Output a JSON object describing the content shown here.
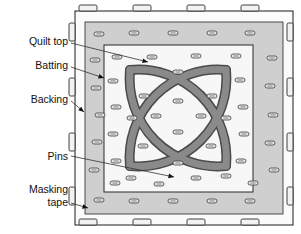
{
  "figure": {
    "type": "diagram"
  },
  "labels": [
    {
      "id": "quilt-top",
      "text": "Quilt top",
      "x": 68,
      "y": 42,
      "leader": {
        "x1": 71,
        "y1": 43,
        "x2": 148,
        "y2": 62
      }
    },
    {
      "id": "batting",
      "text": "Batting",
      "x": 68,
      "y": 66,
      "leader": {
        "x1": 71,
        "y1": 67,
        "x2": 104,
        "y2": 78
      }
    },
    {
      "id": "backing",
      "text": "Backing",
      "x": 68,
      "y": 100,
      "leader": {
        "x1": 71,
        "y1": 101,
        "x2": 84,
        "y2": 112
      }
    },
    {
      "id": "pins",
      "text": "Pins",
      "x": 68,
      "y": 157,
      "leader": {
        "x1": 71,
        "y1": 156,
        "x2": 174,
        "y2": 177
      }
    },
    {
      "id": "masking-1",
      "text": "Masking",
      "x": 68,
      "y": 190,
      "leader": null
    },
    {
      "id": "masking-2",
      "text": "tape",
      "x": 68,
      "y": 203,
      "leader": {
        "x1": 71,
        "y1": 203,
        "x2": 88,
        "y2": 208
      }
    }
  ],
  "colors": {
    "background": "#ffffff",
    "outline": "#1a1a1a",
    "backing": "#fbfbfb",
    "batting": "#cfcfcf",
    "quilt_top": "#f7f7f7",
    "tape": "#f2f2f2",
    "pin_fill": "#e8e8e8",
    "motif_band": "#8a8a8a",
    "motif_outline": "#4a4a4a",
    "label_text": "#101010",
    "leader_line": "#333333"
  },
  "geometry": {
    "backing_rect": {
      "x": 75,
      "y": 11,
      "w": 218,
      "h": 214
    },
    "batting_rect": {
      "x": 85,
      "y": 22,
      "w": 198,
      "h": 192
    },
    "quilt_top_rect": {
      "x": 104,
      "y": 45,
      "w": 149,
      "h": 147
    },
    "motif_center": {
      "cx": 178,
      "cy": 118
    },
    "motif_radius": 62
  },
  "tape_pieces": {
    "top": [
      {
        "x": 88,
        "y": 8
      },
      {
        "x": 142,
        "y": 8
      },
      {
        "x": 196,
        "y": 8
      },
      {
        "x": 250,
        "y": 8
      }
    ],
    "bottom": [
      {
        "x": 88,
        "y": 222
      },
      {
        "x": 142,
        "y": 222
      },
      {
        "x": 196,
        "y": 222
      },
      {
        "x": 250,
        "y": 222
      }
    ],
    "left": [
      {
        "x": 72,
        "y": 32
      },
      {
        "x": 72,
        "y": 87
      },
      {
        "x": 72,
        "y": 142
      },
      {
        "x": 72,
        "y": 196
      }
    ],
    "right": [
      {
        "x": 290,
        "y": 32
      },
      {
        "x": 290,
        "y": 87
      },
      {
        "x": 290,
        "y": 142
      },
      {
        "x": 290,
        "y": 196
      }
    ]
  },
  "pins": [
    {
      "x": 99,
      "y": 34
    },
    {
      "x": 134,
      "y": 33
    },
    {
      "x": 173,
      "y": 33
    },
    {
      "x": 212,
      "y": 33
    },
    {
      "x": 250,
      "y": 33
    },
    {
      "x": 95,
      "y": 60
    },
    {
      "x": 117,
      "y": 57
    },
    {
      "x": 152,
      "y": 57
    },
    {
      "x": 196,
      "y": 56
    },
    {
      "x": 236,
      "y": 56
    },
    {
      "x": 272,
      "y": 58
    },
    {
      "x": 96,
      "y": 88
    },
    {
      "x": 113,
      "y": 81
    },
    {
      "x": 178,
      "y": 72
    },
    {
      "x": 240,
      "y": 80
    },
    {
      "x": 270,
      "y": 86
    },
    {
      "x": 100,
      "y": 115
    },
    {
      "x": 144,
      "y": 96
    },
    {
      "x": 212,
      "y": 96
    },
    {
      "x": 273,
      "y": 115
    },
    {
      "x": 97,
      "y": 142
    },
    {
      "x": 116,
      "y": 107
    },
    {
      "x": 178,
      "y": 101
    },
    {
      "x": 243,
      "y": 107
    },
    {
      "x": 270,
      "y": 143
    },
    {
      "x": 94,
      "y": 170
    },
    {
      "x": 132,
      "y": 118
    },
    {
      "x": 156,
      "y": 116
    },
    {
      "x": 201,
      "y": 116
    },
    {
      "x": 226,
      "y": 118
    },
    {
      "x": 274,
      "y": 170
    },
    {
      "x": 113,
      "y": 134
    },
    {
      "x": 178,
      "y": 132
    },
    {
      "x": 244,
      "y": 134
    },
    {
      "x": 143,
      "y": 146
    },
    {
      "x": 211,
      "y": 146
    },
    {
      "x": 116,
      "y": 161
    },
    {
      "x": 178,
      "y": 163
    },
    {
      "x": 241,
      "y": 161
    },
    {
      "x": 131,
      "y": 178
    },
    {
      "x": 196,
      "y": 178
    },
    {
      "x": 226,
      "y": 176
    },
    {
      "x": 115,
      "y": 183
    },
    {
      "x": 159,
      "y": 184
    },
    {
      "x": 253,
      "y": 183
    },
    {
      "x": 99,
      "y": 200
    },
    {
      "x": 134,
      "y": 201
    },
    {
      "x": 173,
      "y": 201
    },
    {
      "x": 212,
      "y": 201
    },
    {
      "x": 250,
      "y": 201
    }
  ]
}
